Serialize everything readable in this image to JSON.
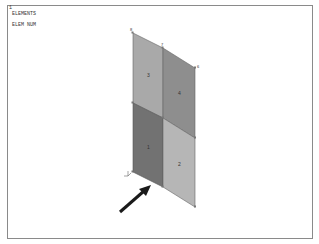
{
  "viewport": {
    "window_number": "1",
    "title_lines": [
      "ELEMENTS",
      "ELEM NUM"
    ]
  },
  "model": {
    "nodes": [
      {
        "id": "8",
        "x": 133,
        "y": 33
      },
      {
        "id": "7",
        "x": 163,
        "y": 48
      },
      {
        "id": "6",
        "x": 195,
        "y": 68
      },
      {
        "id": "4",
        "x": 133,
        "y": 103
      },
      {
        "id": "3",
        "x": 163,
        "y": 118
      },
      {
        "id": "5",
        "x": 195,
        "y": 138
      },
      {
        "id": "1",
        "x": 133,
        "y": 172
      },
      {
        "id": "2",
        "x": 163,
        "y": 187
      },
      {
        "id": "9",
        "x": 195,
        "y": 207
      }
    ],
    "elements": [
      {
        "id": "3",
        "color": "#a9a9a9",
        "label_x": 148,
        "label_y": 76
      },
      {
        "id": "4",
        "color": "#8e8e8e",
        "label_x": 179,
        "label_y": 94
      },
      {
        "id": "1",
        "color": "#727272",
        "label_x": 148,
        "label_y": 148
      },
      {
        "id": "2",
        "color": "#b6b6b6",
        "label_x": 179,
        "label_y": 165
      }
    ]
  },
  "annotation": {
    "arrow_color": "#1a1a1a",
    "arrow_from": [
      120,
      212
    ],
    "arrow_to": [
      150,
      186
    ]
  },
  "colors": {
    "frame_border": "#8a8a8a",
    "edge": "#555555",
    "background": "#ffffff"
  }
}
